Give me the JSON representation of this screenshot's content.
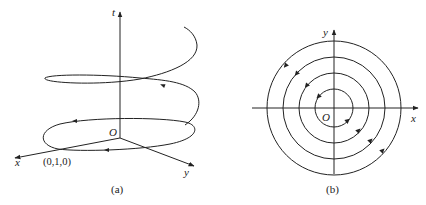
{
  "figure_a": {
    "caption": "(a)",
    "axis_t_label": "t",
    "axis_x_label": "x",
    "axis_y_label": "y",
    "origin_label": "O",
    "start_point_label": "(0,1,0)",
    "curve": "helix"
  },
  "figure_b": {
    "caption": "(b)",
    "axis_x_label": "x",
    "axis_y_label": "y",
    "origin_label": "O",
    "circle_count": 4,
    "curve": "concentric circles (projection)"
  },
  "colors": {
    "stroke": "#222222",
    "background": "#ffffff"
  }
}
